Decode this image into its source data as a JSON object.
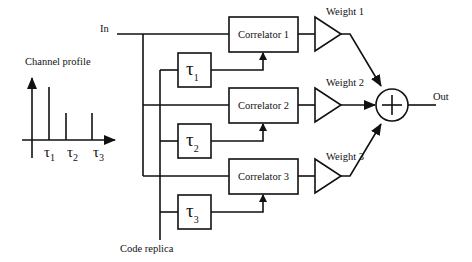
{
  "diagram": {
    "type": "RAKE receiver block diagram",
    "input_label": "In",
    "output_label": "Out",
    "code_replica_label": "Code replica",
    "channel_profile": {
      "title": "Channel profile",
      "taps": [
        {
          "symbol": "τ",
          "subscript": "1",
          "relative_height": 1.0
        },
        {
          "symbol": "τ",
          "subscript": "2",
          "relative_height": 0.5
        },
        {
          "symbol": "τ",
          "subscript": "3",
          "relative_height": 0.5
        }
      ]
    },
    "fingers": [
      {
        "correlator_label": "Correlator 1",
        "delay_symbol": "τ",
        "delay_subscript": "1",
        "weight_label": "Weight 1"
      },
      {
        "correlator_label": "Correlator 2",
        "delay_symbol": "τ",
        "delay_subscript": "2",
        "weight_label": "Weight 2"
      },
      {
        "correlator_label": "Correlator 3",
        "delay_symbol": "τ",
        "delay_subscript": "3",
        "weight_label": "Weight 3"
      }
    ],
    "summer_symbol": "+"
  }
}
